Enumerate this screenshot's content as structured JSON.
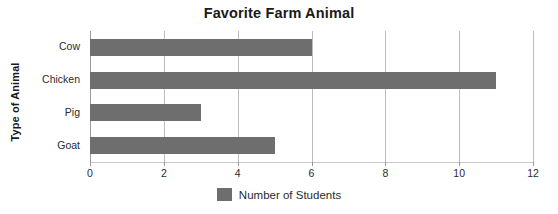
{
  "chart_data": {
    "type": "bar",
    "orientation": "horizontal",
    "title": "Favorite Farm Animal",
    "xlabel": "",
    "ylabel": "Type of Animal",
    "categories": [
      "Cow",
      "Chicken",
      "Pig",
      "Goat"
    ],
    "values": [
      6,
      11,
      3,
      5
    ],
    "series": [
      {
        "name": "Number of Students",
        "values": [
          6,
          11,
          3,
          5
        ]
      }
    ],
    "xlim": [
      0,
      12
    ],
    "xticks": [
      0,
      2,
      4,
      6,
      8,
      10,
      12
    ],
    "xtick_labels": [
      "0",
      "2",
      "4",
      "6",
      "8",
      "10",
      "12"
    ],
    "grid": true,
    "grid_axis": "x",
    "legend": {
      "position": "bottom",
      "entries": [
        {
          "label": "Number of Students",
          "color": "#6e6e6e"
        }
      ]
    },
    "colors": {
      "bar": "#6e6e6e",
      "gridline": "#bdbdbd",
      "axis": "#9a9a9a",
      "text": "#2b2b2b",
      "title_text": "#1a1a1a",
      "background": "#ffffff"
    }
  }
}
